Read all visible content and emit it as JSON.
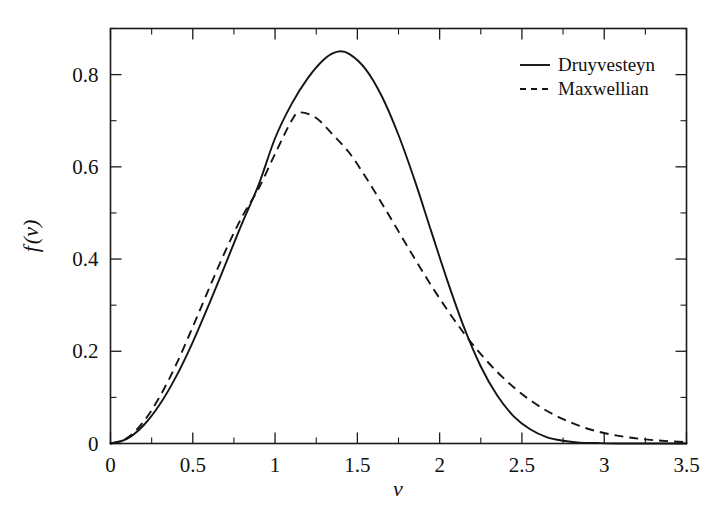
{
  "chart_data": {
    "type": "line",
    "title": "",
    "xlabel": "v",
    "ylabel": "f(v)",
    "xlim": [
      0,
      3.5
    ],
    "ylim": [
      0,
      0.9
    ],
    "grid": false,
    "legend_position": "top-right",
    "x_ticks": [
      "0",
      "0.5",
      "1",
      "1.5",
      "2",
      "2.5",
      "3",
      "3.5"
    ],
    "x_tick_values": [
      0,
      0.5,
      1,
      1.5,
      2,
      2.5,
      3,
      3.5
    ],
    "x_minor_step": 0.25,
    "y_ticks": [
      "0",
      "0.2",
      "0.4",
      "0.6",
      "0.8"
    ],
    "y_tick_values": [
      0,
      0.2,
      0.4,
      0.6,
      0.8
    ],
    "y_minor_step": 0.1,
    "annotations": {
      "druyvesteyn_peak": {
        "v": 1.38,
        "f": 0.85
      },
      "maxwellian_peak": {
        "v": 1.15,
        "f": 0.72
      },
      "crossing_point": {
        "v": 2.08,
        "f": 0.24
      }
    },
    "series": [
      {
        "name": "Druyvesteyn",
        "style": "solid",
        "color": "#141414",
        "x": [
          0.0,
          0.1,
          0.2,
          0.3,
          0.4,
          0.5,
          0.6,
          0.7,
          0.8,
          0.9,
          1.0,
          1.1,
          1.2,
          1.3,
          1.38,
          1.45,
          1.55,
          1.65,
          1.75,
          1.85,
          1.95,
          2.05,
          2.15,
          2.25,
          2.35,
          2.45,
          2.55,
          2.65,
          2.75,
          2.85,
          2.95,
          3.1,
          3.3,
          3.5
        ],
        "y": [
          0.0,
          0.01,
          0.039,
          0.085,
          0.146,
          0.22,
          0.303,
          0.39,
          0.478,
          0.561,
          0.662,
          0.736,
          0.793,
          0.834,
          0.85,
          0.845,
          0.812,
          0.752,
          0.669,
          0.569,
          0.459,
          0.35,
          0.25,
          0.167,
          0.104,
          0.059,
          0.031,
          0.014,
          0.006,
          0.002,
          0.001,
          0.0,
          0.0,
          0.0
        ]
      },
      {
        "name": "Maxwellian",
        "style": "dashed",
        "color": "#141414",
        "x": [
          0.0,
          0.1,
          0.2,
          0.3,
          0.4,
          0.5,
          0.6,
          0.7,
          0.8,
          0.9,
          1.0,
          1.1,
          1.15,
          1.25,
          1.35,
          1.45,
          1.55,
          1.65,
          1.75,
          1.85,
          1.95,
          2.05,
          2.15,
          2.25,
          2.35,
          2.45,
          2.55,
          2.65,
          2.75,
          2.85,
          2.95,
          3.05,
          3.15,
          3.25,
          3.35,
          3.5
        ],
        "y": [
          0.0,
          0.012,
          0.047,
          0.102,
          0.172,
          0.253,
          0.337,
          0.419,
          0.492,
          0.553,
          0.628,
          0.7,
          0.718,
          0.706,
          0.67,
          0.631,
          0.578,
          0.52,
          0.46,
          0.4,
          0.342,
          0.288,
          0.238,
          0.194,
          0.155,
          0.122,
          0.094,
          0.071,
          0.053,
          0.038,
          0.027,
          0.019,
          0.013,
          0.009,
          0.006,
          0.003
        ]
      }
    ]
  },
  "legend": {
    "items": [
      {
        "label": "Druyvesteyn",
        "style": "solid"
      },
      {
        "label": "Maxwellian",
        "style": "dashed"
      }
    ]
  }
}
